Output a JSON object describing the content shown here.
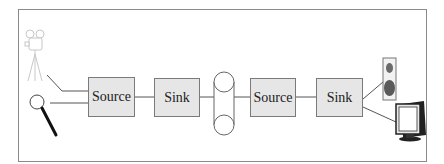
{
  "diagram": {
    "type": "pipeline",
    "nodes": [
      {
        "id": "camera",
        "kind": "icon",
        "label": "video-camera-on-tripod"
      },
      {
        "id": "magnifier",
        "kind": "icon",
        "label": "magnifying-glass"
      },
      {
        "id": "source1",
        "kind": "box",
        "label": "Source"
      },
      {
        "id": "sink1",
        "kind": "box",
        "label": "Sink"
      },
      {
        "id": "tape",
        "kind": "icon",
        "label": "tape-reel-storage"
      },
      {
        "id": "source2",
        "kind": "box",
        "label": "Source"
      },
      {
        "id": "sink2",
        "kind": "box",
        "label": "Sink"
      },
      {
        "id": "speaker",
        "kind": "icon",
        "label": "loudspeaker"
      },
      {
        "id": "monitor",
        "kind": "icon",
        "label": "computer-monitor"
      }
    ],
    "edges": [
      [
        "camera",
        "source1"
      ],
      [
        "magnifier",
        "source1"
      ],
      [
        "source1",
        "sink1"
      ],
      [
        "sink1",
        "tape"
      ],
      [
        "tape",
        "source2"
      ],
      [
        "source2",
        "sink2"
      ],
      [
        "sink2",
        "speaker"
      ],
      [
        "sink2",
        "monitor"
      ]
    ],
    "colors": {
      "box_fill": "#e6e6e6",
      "box_border": "#7a7a7a",
      "line": "#555555",
      "frame": "#8a8a8a",
      "camera": "#d0d0d0",
      "speaker_body": "#f0f0f0",
      "speaker_cone": "#666666"
    }
  }
}
